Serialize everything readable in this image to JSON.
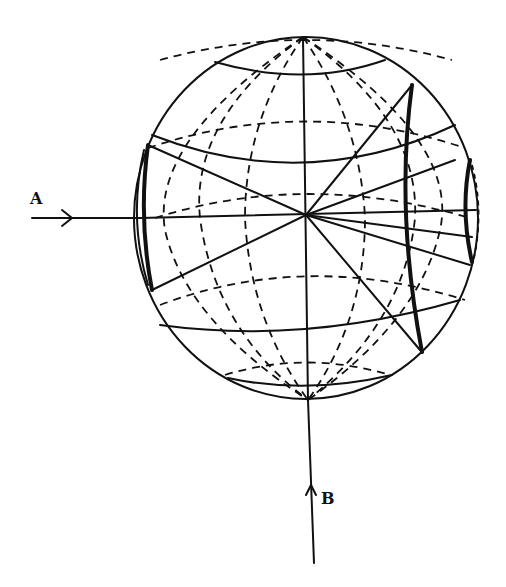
{
  "diagram": {
    "title": "",
    "type": "sphere-projection",
    "labels": {
      "ray_a": "A",
      "ray_b": "B"
    },
    "elements": {
      "sphere": {
        "cx": 306,
        "cy": 218,
        "rx": 172,
        "ry": 181
      },
      "ray_a": {
        "from": [
          32,
          218
        ],
        "to": [
          306,
          218
        ],
        "direction": "right"
      },
      "ray_b": {
        "from": [
          314,
          563
        ],
        "to": [
          308,
          400
        ],
        "direction": "up"
      }
    },
    "colors": {
      "ink": "#111111",
      "background": "#ffffff"
    }
  }
}
